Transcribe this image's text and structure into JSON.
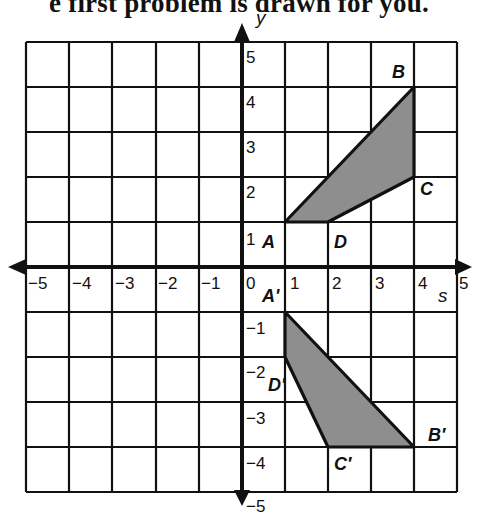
{
  "header": {
    "title": "e first problem is drawn for you."
  },
  "grid": {
    "xmin": -5,
    "xmax": 5,
    "ymin": -5,
    "ymax": 5,
    "x_axis_label": "s",
    "y_axis_label": "y",
    "x_ticks": [
      "−5",
      "−4",
      "−3",
      "−2",
      "−1",
      "0",
      "1",
      "2",
      "3",
      "4",
      "5"
    ],
    "y_ticks": [
      "5",
      "4",
      "3",
      "2",
      "1",
      "−1",
      "−2",
      "−3",
      "−4",
      "−5"
    ]
  },
  "colors": {
    "shade": "#8e8e8e",
    "line": "#111111"
  },
  "figures": [
    {
      "name": "original",
      "vertices": [
        {
          "label": "A",
          "x": 1,
          "y": 1
        },
        {
          "label": "B",
          "x": 4,
          "y": 4
        },
        {
          "label": "C",
          "x": 4,
          "y": 2
        },
        {
          "label": "D",
          "x": 2,
          "y": 1
        }
      ]
    },
    {
      "name": "image",
      "vertices": [
        {
          "label": "A'",
          "x": 1,
          "y": -1
        },
        {
          "label": "B'",
          "x": 4,
          "y": -4
        },
        {
          "label": "C'",
          "x": 2,
          "y": -4
        },
        {
          "label": "D'",
          "x": 1,
          "y": -2
        }
      ]
    }
  ],
  "labels": {
    "A": "A",
    "B": "B",
    "C": "C",
    "D": "D",
    "A_prime": "A'",
    "B_prime": "B′",
    "C_prime": "C′",
    "D_prime": "D'"
  }
}
